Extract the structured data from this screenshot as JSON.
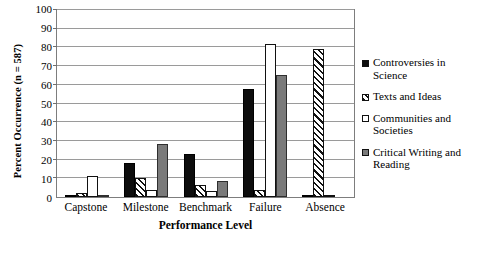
{
  "chart_data": {
    "type": "bar",
    "title": "",
    "xlabel": "Performance Level",
    "ylabel": "Percent Occurrence (n = 587)",
    "categories": [
      "Capstone",
      "Milestone",
      "Benchmark",
      "Failure",
      "Absence"
    ],
    "ylim": [
      0,
      100
    ],
    "yticks": [
      0,
      10,
      20,
      30,
      40,
      50,
      60,
      70,
      80,
      90,
      100
    ],
    "grid": true,
    "legend_position": "right",
    "series": [
      {
        "name": "Controversies in Science",
        "fill": "solid-black",
        "color": "#0d0d0d",
        "values": [
          1,
          18,
          23,
          58,
          1
        ]
      },
      {
        "name": "Texts and Ideas",
        "fill": "diagonal-hatch",
        "color": "#ffffff",
        "values": [
          2,
          10,
          6.5,
          4,
          79
        ]
      },
      {
        "name": "Communities and Societies",
        "fill": "white-outline",
        "color": "#ffffff",
        "values": [
          11,
          4,
          3,
          82,
          1
        ]
      },
      {
        "name": "Critical Writing and Reading",
        "fill": "solid-gray",
        "color": "#7a7a7a",
        "values": [
          1,
          28.5,
          8.5,
          65,
          0
        ]
      }
    ]
  },
  "legend": {
    "items": [
      {
        "label": "Controversies in Science",
        "swatch": "solid-black-square-icon"
      },
      {
        "label": "Texts and Ideas",
        "swatch": "hatched-square-icon"
      },
      {
        "label": "Communities and Societies",
        "swatch": "white-square-icon"
      },
      {
        "label": "Critical Writing and Reading",
        "swatch": "gray-square-icon"
      }
    ]
  },
  "colors": {
    "series_1": "#0d0d0d",
    "series_2": "#ffffff",
    "series_3": "#ffffff",
    "series_4": "#7a7a7a",
    "axis": "#7d7d7d",
    "gridline": "#9a9a9a"
  }
}
